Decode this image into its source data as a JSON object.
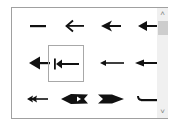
{
  "gallery": {
    "title": "Arrow styles",
    "items": [
      {
        "name": "none",
        "label": ""
      },
      {
        "name": "open-arrow",
        "label": ""
      },
      {
        "name": "stealth-arrow",
        "label": ""
      },
      {
        "name": "arrow",
        "label": ""
      },
      {
        "name": "large-arrow",
        "label": ""
      },
      {
        "name": "bar-arrow",
        "label": "",
        "selected": true
      },
      {
        "name": "small-arrow",
        "label": ""
      },
      {
        "name": "medium-arrow",
        "label": ""
      },
      {
        "name": "double-arrow",
        "label": ""
      },
      {
        "name": "feather-arrow",
        "label": ""
      },
      {
        "name": "reverse-feather-arrow",
        "label": ""
      },
      {
        "name": "hook-arrow",
        "label": ""
      }
    ],
    "selected_index": 5
  },
  "scrollbar": {
    "up_glyph": "˄",
    "down_glyph": "˅"
  },
  "colors": {
    "border": "#a0a0a0",
    "arrow": "#000000",
    "scroll_track": "#f0f0f0",
    "scroll_thumb": "#cdcdcd"
  }
}
